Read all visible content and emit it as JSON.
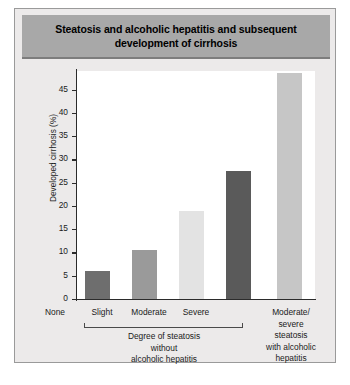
{
  "figure": {
    "title": "Steatosis and alcoholic hepatitis and subsequent development of cirrhosis",
    "banner_color": "#a8a8a8",
    "background_color": "#eceaea"
  },
  "chart_data": {
    "type": "bar",
    "title": "Steatosis and alcoholic hepatitis and subsequent development of cirrhosis",
    "xlabel": "",
    "ylabel": "Developed cirrhosis (%)",
    "ylim": [
      0,
      49
    ],
    "yticks": [
      0,
      5,
      10,
      15,
      20,
      25,
      30,
      35,
      40,
      45
    ],
    "ytick_labels": [
      "0",
      "5",
      "10",
      "15",
      "20",
      "25",
      "30",
      "35",
      "40",
      "45"
    ],
    "grid": false,
    "legend": "none",
    "categories": [
      "None",
      "Slight",
      "Moderate",
      "Severe",
      "Moderate/severe steatosis with alcoholic hepatitis"
    ],
    "values": [
      6,
      10.5,
      19,
      27.5,
      48.5
    ],
    "bar_colors": [
      "#6e6e6e",
      "#9a9a9a",
      "#e3e3e3",
      "#5a5a5a",
      "#c6c6c6"
    ],
    "group_labels": [
      "Degree of steatosis without alcoholic hepatitis",
      "Moderate/severe steatosis with alcoholic hepatitis"
    ]
  },
  "axis": {
    "y_title": "Developed cirrhosis (%)"
  },
  "x_labels": {
    "cat1": "None",
    "cat2": "Slight",
    "cat3": "Moderate",
    "cat4": "Severe",
    "group1_line1": "Degree of steatosis",
    "group1_line2": "without",
    "group1_line3": "alcoholic hepatitis",
    "group2_line1": "Moderate/",
    "group2_line2": "severe",
    "group2_line3": "steatosis",
    "group2_line4": "with alcoholic",
    "group2_line5": "hepatitis"
  },
  "ticks": {
    "t0": "0",
    "t1": "5",
    "t2": "10",
    "t3": "15",
    "t4": "20",
    "t5": "25",
    "t6": "30",
    "t7": "35",
    "t8": "40",
    "t9": "45"
  }
}
